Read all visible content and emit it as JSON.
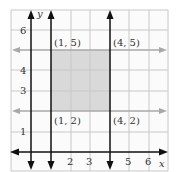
{
  "graph": {
    "x_axis_label": "x",
    "y_axis_label": "y",
    "x_ticks": [
      "2",
      "3",
      "5",
      "6"
    ],
    "y_ticks": [
      "1",
      "3",
      "4",
      "6"
    ],
    "points": [
      {
        "label": "(1, 5)",
        "x": 1,
        "y": 5
      },
      {
        "label": "(4, 5)",
        "x": 4,
        "y": 5
      },
      {
        "label": "(1, 2)",
        "x": 1,
        "y": 2
      },
      {
        "label": "(4, 2)",
        "x": 4,
        "y": 2
      }
    ],
    "vertical_lines": [
      "x = 1",
      "x = 4"
    ],
    "horizontal_lines": [
      "y = 5",
      "y = 2"
    ],
    "shaded_region": "1 ≤ x ≤ 4, 2 ≤ y ≤ 5",
    "colors": {
      "grid": "#c8c8c8",
      "shade": "#d9d9d9",
      "axis": "#111111",
      "horizontal_line": "#a8a8a8"
    }
  }
}
